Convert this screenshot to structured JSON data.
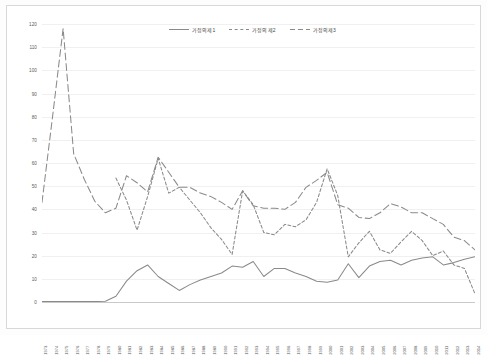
{
  "chart_data": {
    "type": "line",
    "title": "",
    "xlabel": "",
    "ylabel": "",
    "ylim": [
      0,
      120
    ],
    "ytick_step": 10,
    "grid": true,
    "legend_position": "top-center",
    "yticks": [
      "0",
      "10",
      "20",
      "30",
      "40",
      "50",
      "60",
      "70",
      "80",
      "90",
      "100",
      "110",
      "120"
    ],
    "categories": [
      "1973",
      "1974",
      "1975",
      "1976",
      "1977",
      "1978",
      "1979",
      "1980",
      "1981",
      "1982",
      "1983",
      "1984",
      "1985",
      "1986",
      "1987",
      "1988",
      "1989",
      "1990",
      "1991",
      "1992",
      "1993",
      "1994",
      "1995",
      "1996",
      "1997",
      "1998",
      "1999",
      "2000",
      "2001",
      "2002",
      "2003",
      "2004",
      "2005",
      "2006",
      "2007",
      "2008",
      "2009",
      "2010",
      "2011",
      "2012",
      "2013",
      "2014"
    ],
    "series": [
      {
        "name": "가정의제1",
        "style": "solid",
        "color": "#8a8a8a",
        "values": [
          0.2,
          0.2,
          0.2,
          0.2,
          0.2,
          0.2,
          0.3,
          2.5,
          9.0,
          13.5,
          16.0,
          11.0,
          8.0,
          5.0,
          7.5,
          9.5,
          11.0,
          12.5,
          15.5,
          15.0,
          17.5,
          11.0,
          14.5,
          14.5,
          12.5,
          11.0,
          9.0,
          8.5,
          9.5,
          16.5,
          10.5,
          15.5,
          17.5,
          18.0,
          16.0,
          18.0,
          19.0,
          19.5,
          16.0,
          17.0,
          18.5,
          19.5
        ]
      },
      {
        "name": "가정의제2",
        "style": "shortdash",
        "color": "#8a8a8a",
        "values": [
          null,
          null,
          null,
          null,
          null,
          null,
          null,
          53.5,
          44.0,
          31.0,
          45.5,
          62.0,
          47.0,
          49.5,
          44.0,
          38.5,
          32.0,
          27.0,
          20.5,
          48.0,
          42.0,
          30.0,
          29.0,
          33.5,
          32.5,
          35.5,
          43.0,
          57.5,
          46.0,
          19.5,
          25.5,
          30.5,
          22.5,
          21.0,
          26.0,
          30.5,
          26.5,
          20.0,
          22.0,
          16.0,
          14.5,
          3.5
        ]
      },
      {
        "name": "가정의제3",
        "style": "longdash",
        "color": "#8a8a8a",
        "values": [
          43.0,
          80.0,
          118.0,
          64.0,
          53.0,
          43.5,
          38.5,
          40.5,
          54.5,
          51.5,
          47.5,
          62.5,
          56.0,
          49.5,
          49.5,
          47.0,
          45.5,
          43.0,
          40.0,
          48.0,
          41.5,
          40.5,
          40.5,
          40.0,
          43.0,
          49.5,
          52.5,
          56.0,
          42.0,
          40.5,
          36.5,
          36.0,
          38.5,
          42.5,
          41.0,
          38.5,
          38.5,
          36.0,
          33.5,
          28.0,
          26.5,
          22.5
        ]
      }
    ]
  },
  "legend": {
    "items": [
      {
        "label": "가정의제1",
        "style": "solid"
      },
      {
        "label": "가정의제2",
        "style": "shortdash"
      },
      {
        "label": "가정의제3",
        "style": "longdash"
      }
    ]
  }
}
